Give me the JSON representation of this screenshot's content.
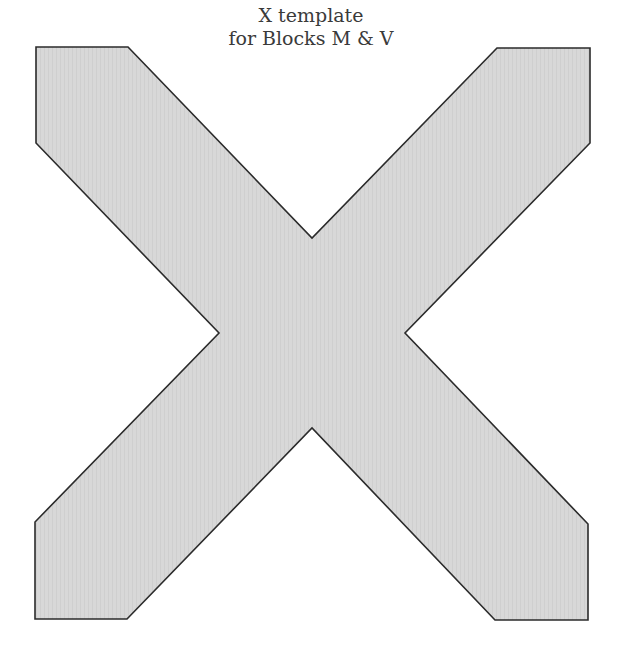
{
  "title": {
    "line1": "X template",
    "line2": "for Blocks M & V"
  },
  "shape": {
    "name": "X template",
    "fill": "#d6d6d6",
    "stroke": "#2b2b2b",
    "points": "36,47 128,47 312,238 497,48 590,48 590,143 405,333 588,524 588,620 495,620 312,428 127,619 35,619 35,522 219,333 36,143"
  },
  "colors": {
    "background": "#ffffff",
    "text": "#3a3a3a"
  }
}
